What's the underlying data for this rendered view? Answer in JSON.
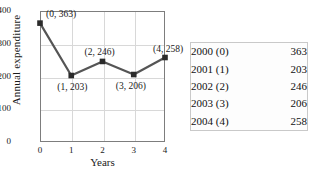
{
  "chart_data": {
    "type": "line",
    "title": "",
    "xlabel": "Years",
    "ylabel": "Annual expenditure",
    "x": [
      0,
      1,
      2,
      3,
      4
    ],
    "values": [
      363,
      203,
      246,
      206,
      258
    ],
    "xlim": [
      0,
      4
    ],
    "ylim": [
      0,
      400
    ],
    "xticks": [
      "0",
      "1",
      "2",
      "3",
      "4"
    ],
    "yticks": [
      "400",
      "300",
      "200",
      "100",
      "0"
    ],
    "grid": true,
    "legend": "none",
    "marker": "square",
    "line_color": "#555555",
    "marker_color": "#2b2b2b",
    "point_labels": [
      "(0, 363)",
      "(1, 203)",
      "(2, 246)",
      "(3, 206)",
      "(4, 258)"
    ]
  },
  "data_table": {
    "rows": [
      {
        "year": "2000 (0)",
        "value": "363"
      },
      {
        "year": "2001 (1)",
        "value": "203"
      },
      {
        "year": "2002 (2)",
        "value": "246"
      },
      {
        "year": "2003 (3)",
        "value": "206"
      },
      {
        "year": "2004 (4)",
        "value": "258"
      }
    ]
  }
}
